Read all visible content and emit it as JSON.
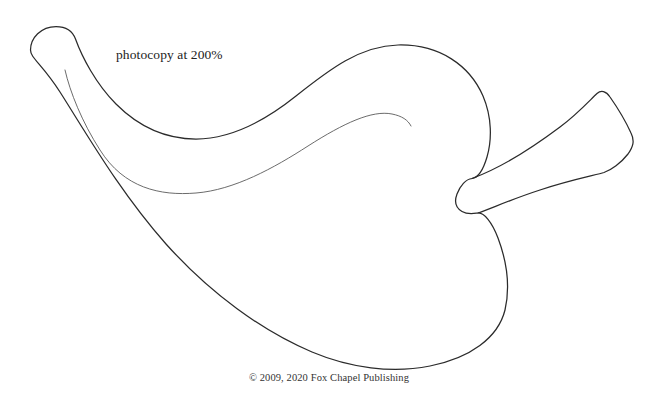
{
  "page": {
    "background_color": "#ffffff",
    "width": 658,
    "height": 406
  },
  "annotations": {
    "instruction": "photocopy at 200%",
    "copyright": "© 2009, 2020 Fox Chapel Publishing"
  },
  "drawing": {
    "name": "dove-pattern-outline",
    "stroke_color": "#2b2b2b",
    "inner_stroke_color": "#5a5a5a",
    "fill": "none",
    "shapes": [
      {
        "name": "body-outline",
        "description": "Main dove body silhouette including head, back, breast and tail notch"
      },
      {
        "name": "tail-outline",
        "description": "Angled tail feather shape extending to the upper right"
      },
      {
        "name": "wing-inner-line",
        "description": "Thin interior contour line suggesting the wing / neck feathering"
      }
    ]
  }
}
